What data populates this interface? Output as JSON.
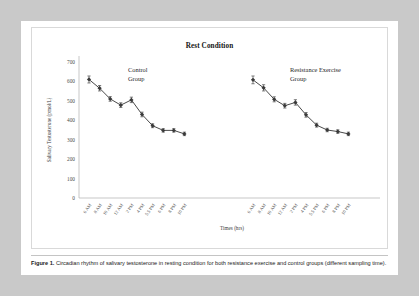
{
  "page": {
    "background_color": "#c9c9c9",
    "card_color": "#ffffff"
  },
  "caption": {
    "label": "Figure 1.",
    "text": "Circadian rhythm of salivary testosterone in resting condition for both resistance exercise and control groups (different sampling time)."
  },
  "chart_data": {
    "type": "line",
    "title": "Rest Condition",
    "xlabel": "Times (hrs)",
    "ylabel": "Salivary Testosterone (pmol/L)",
    "ylim": [
      0,
      700
    ],
    "yticks": [
      0,
      100,
      200,
      300,
      400,
      500,
      600,
      700
    ],
    "grid": false,
    "legend_position": "inline-annotation",
    "marker_color": "#3a3a3a",
    "line_color": "#4a4a4a",
    "categories": [
      "6 AM",
      "8 AM",
      "10 AM",
      "12 AM",
      "2 PM",
      "4 PM",
      "5.5 PM",
      "8 PM",
      "8 PM",
      "10 PM"
    ],
    "xticklabels": [
      "6 AM",
      "8 AM",
      "10 AM",
      "12 AM",
      "2 PM",
      "4 PM",
      "5.5 PM",
      "6 PM",
      "8 PM",
      "10 PM"
    ],
    "series": [
      {
        "name": "Control Group",
        "annotation": "Control\nGroup",
        "values": [
          610,
          565,
          510,
          478,
          505,
          430,
          372,
          348,
          348,
          330
        ],
        "errors": [
          18,
          14,
          12,
          12,
          14,
          12,
          10,
          9,
          9,
          9
        ]
      },
      {
        "name": "Resistance Exercise Group",
        "annotation": "Resistance Exercise\nGroup",
        "values": [
          608,
          567,
          508,
          475,
          492,
          428,
          375,
          350,
          342,
          330
        ],
        "errors": [
          20,
          16,
          13,
          12,
          14,
          12,
          10,
          9,
          9,
          9
        ]
      }
    ]
  },
  "annotations": {
    "control": {
      "line1": "Control",
      "line2": "Group"
    },
    "exercise": {
      "line1": "Resistance Exercise",
      "line2": "Group"
    }
  }
}
